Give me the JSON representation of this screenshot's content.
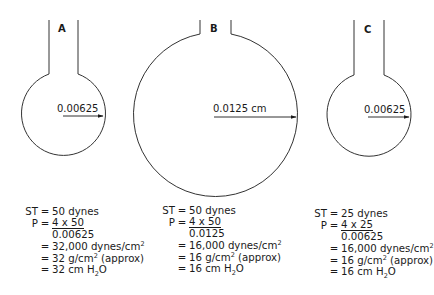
{
  "diagram": {
    "formula": "P = 4 x ST / r",
    "line_color": "#333333",
    "bubbles": [
      {
        "id": "A",
        "letter": "A",
        "radius_label": "0.00625",
        "radius_cm": 0.00625,
        "tube": "long",
        "calc": {
          "st_lhs": "ST",
          "st_rhs": "50 dynes",
          "p_lhs": "P",
          "numerator": "4 x 50",
          "denominator": "0.00625",
          "result_dynes": "32,000 dynes/cm",
          "result_g": "32 g/cm",
          "result_g_suffix": " (approx)",
          "result_cm": "32 cm H",
          "result_cm_suffix": "O",
          "eq": "="
        }
      },
      {
        "id": "B",
        "letter": "B",
        "radius_label": "0.0125 cm",
        "radius_cm": 0.0125,
        "tube": "short",
        "calc": {
          "st_lhs": "ST",
          "st_rhs": "50 dynes",
          "p_lhs": "P",
          "numerator": "4 x 50",
          "denominator": "0.0125",
          "result_dynes": "16,000 dynes/cm",
          "result_g": "16 g/cm",
          "result_g_suffix": " (approx)",
          "result_cm": "16 cm H",
          "result_cm_suffix": "O",
          "eq": "="
        }
      },
      {
        "id": "C",
        "letter": "C",
        "radius_label": "0.00625",
        "radius_cm": 0.00625,
        "tube": "long",
        "calc": {
          "st_lhs": "ST",
          "st_rhs": "25 dynes",
          "p_lhs": "P",
          "numerator": "4 x 25",
          "denominator": "0.00625",
          "result_dynes": "16,000 dynes/cm",
          "result_g": "16 g/cm",
          "result_g_suffix": " (approx)",
          "result_cm": "16 cm H",
          "result_cm_suffix": "O",
          "eq": "="
        }
      }
    ],
    "superscript": "2",
    "subscript": "2"
  }
}
